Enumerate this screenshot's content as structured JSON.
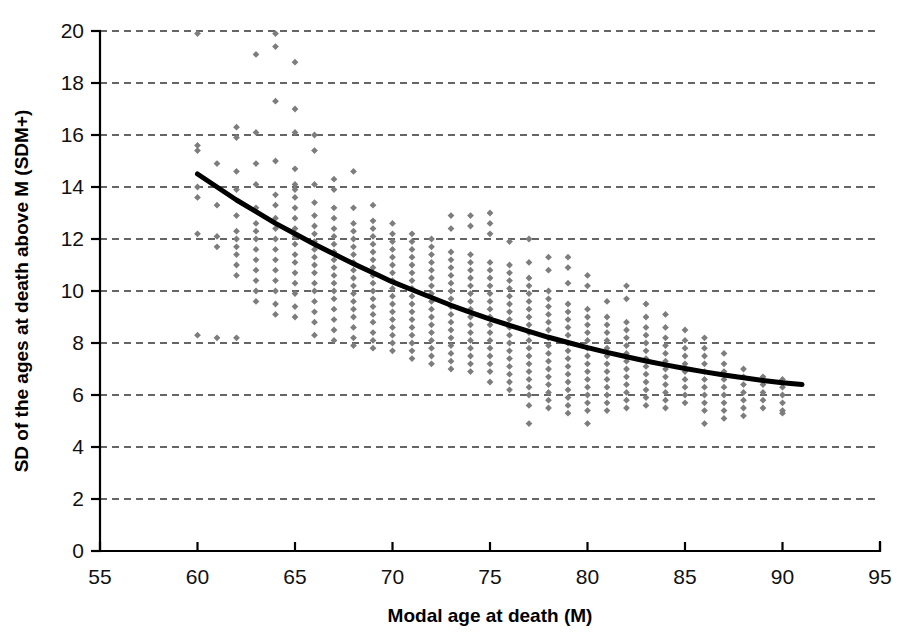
{
  "chart_data": {
    "type": "scatter",
    "title": "",
    "xlabel": "Modal age at death (M)",
    "ylabel": "SD of the ages at death above M (SDM+)",
    "xlim": [
      55,
      95
    ],
    "ylim": [
      0,
      20
    ],
    "xticks": [
      55,
      60,
      65,
      70,
      75,
      80,
      85,
      90,
      95
    ],
    "yticks": [
      0,
      2,
      4,
      6,
      8,
      10,
      12,
      14,
      16,
      18,
      20
    ],
    "grid": "horizontal-dashed",
    "legend": "none",
    "marker_shape": "diamond",
    "marker_color": "#7d7d7d",
    "series": [
      {
        "name": "SDM+ observations",
        "points_by_x": [
          {
            "x": 60,
            "values": [
              19.9,
              15.6,
              15.4,
              14.0,
              13.6,
              12.2,
              8.3
            ]
          },
          {
            "x": 61,
            "values": [
              14.9,
              13.3,
              12.1,
              11.7,
              8.2
            ]
          },
          {
            "x": 62,
            "values": [
              16.3,
              15.9,
              14.6,
              13.9,
              12.9,
              12.3,
              12.0,
              11.7,
              11.4,
              11.0,
              10.6,
              8.2
            ]
          },
          {
            "x": 63,
            "values": [
              19.1,
              16.1,
              14.9,
              14.1,
              13.2,
              12.6,
              12.3,
              12.0,
              11.6,
              11.2,
              10.8,
              10.4,
              10.0,
              9.6
            ]
          },
          {
            "x": 64,
            "values": [
              19.9,
              19.4,
              17.3,
              15.0,
              13.7,
              13.3,
              12.8,
              12.4,
              12.0,
              11.6,
              11.2,
              10.8,
              10.4,
              10.0,
              9.5,
              9.1
            ]
          },
          {
            "x": 65,
            "values": [
              18.8,
              17.0,
              16.1,
              14.7,
              14.1,
              13.9,
              13.6,
              13.2,
              12.8,
              12.4,
              12.1,
              11.8,
              11.4,
              11.1,
              10.7,
              10.3,
              9.9,
              9.4,
              9.0
            ]
          },
          {
            "x": 66,
            "values": [
              16.0,
              15.4,
              14.1,
              13.4,
              12.9,
              12.5,
              12.2,
              11.9,
              11.6,
              11.3,
              11.0,
              10.7,
              10.3,
              10.0,
              9.6,
              9.2,
              8.8,
              8.3
            ]
          },
          {
            "x": 67,
            "values": [
              14.3,
              13.9,
              13.2,
              12.8,
              12.4,
              12.1,
              11.8,
              11.5,
              11.2,
              10.9,
              10.6,
              10.3,
              10.0,
              9.7,
              9.3,
              8.9,
              8.5,
              8.1
            ]
          },
          {
            "x": 68,
            "values": [
              14.6,
              13.2,
              12.6,
              12.3,
              12.0,
              11.7,
              11.4,
              11.1,
              10.8,
              10.5,
              10.2,
              9.9,
              9.6,
              9.3,
              9.0,
              8.6,
              8.2,
              7.9
            ]
          },
          {
            "x": 69,
            "values": [
              13.3,
              12.7,
              12.4,
              12.1,
              11.8,
              11.5,
              11.2,
              10.9,
              10.6,
              10.3,
              10.0,
              9.7,
              9.4,
              9.1,
              8.8,
              8.4,
              8.1,
              7.8
            ]
          },
          {
            "x": 70,
            "values": [
              12.6,
              12.2,
              11.9,
              11.6,
              11.3,
              11.0,
              10.7,
              10.4,
              10.1,
              9.8,
              9.5,
              9.2,
              8.9,
              8.6,
              8.3,
              8.0,
              7.7
            ]
          },
          {
            "x": 71,
            "values": [
              12.2,
              11.9,
              11.6,
              11.3,
              11.0,
              10.7,
              10.4,
              10.1,
              9.8,
              9.5,
              9.2,
              8.9,
              8.6,
              8.3,
              8.0,
              7.7,
              7.4
            ]
          },
          {
            "x": 72,
            "values": [
              12.0,
              11.7,
              11.4,
              11.1,
              10.8,
              10.5,
              10.2,
              9.9,
              9.6,
              9.3,
              9.0,
              8.7,
              8.4,
              8.1,
              7.8,
              7.5,
              7.2
            ]
          },
          {
            "x": 73,
            "values": [
              12.9,
              12.4,
              11.5,
              11.2,
              10.9,
              10.6,
              10.3,
              10.0,
              9.7,
              9.4,
              9.1,
              8.8,
              8.5,
              8.2,
              7.9,
              7.6,
              7.3,
              7.0
            ]
          },
          {
            "x": 74,
            "values": [
              12.9,
              12.5,
              11.4,
              11.1,
              10.8,
              10.5,
              10.2,
              9.9,
              9.6,
              9.3,
              9.0,
              8.7,
              8.4,
              8.1,
              7.8,
              7.5,
              7.2,
              6.9
            ]
          },
          {
            "x": 75,
            "values": [
              13.0,
              12.6,
              12.2,
              11.1,
              10.8,
              10.5,
              10.2,
              9.9,
              9.6,
              9.3,
              9.0,
              8.7,
              8.4,
              8.1,
              7.8,
              7.5,
              7.2,
              6.9,
              6.5
            ]
          },
          {
            "x": 76,
            "values": [
              11.9,
              11.0,
              10.7,
              10.4,
              10.1,
              9.8,
              9.5,
              9.2,
              8.9,
              8.6,
              8.3,
              8.0,
              7.7,
              7.4,
              7.1,
              6.8,
              6.5,
              6.2
            ]
          },
          {
            "x": 77,
            "values": [
              12.0,
              11.1,
              10.5,
              10.2,
              9.9,
              9.6,
              9.3,
              9.0,
              8.7,
              8.4,
              8.1,
              7.8,
              7.5,
              7.2,
              6.9,
              6.6,
              6.3,
              6.0,
              5.6,
              4.9
            ]
          },
          {
            "x": 78,
            "values": [
              11.3,
              10.8,
              10.0,
              9.7,
              9.4,
              9.1,
              8.8,
              8.5,
              8.2,
              7.9,
              7.6,
              7.3,
              7.0,
              6.7,
              6.4,
              6.1,
              5.8,
              5.5
            ]
          },
          {
            "x": 79,
            "values": [
              11.3,
              10.9,
              10.3,
              9.5,
              9.2,
              8.9,
              8.6,
              8.3,
              8.0,
              7.7,
              7.4,
              7.1,
              6.8,
              6.5,
              6.2,
              5.9,
              5.6,
              5.3
            ]
          },
          {
            "x": 80,
            "values": [
              10.6,
              10.2,
              9.3,
              9.0,
              8.7,
              8.4,
              8.1,
              7.8,
              7.5,
              7.2,
              6.9,
              6.6,
              6.3,
              6.0,
              5.7,
              5.4,
              4.9
            ]
          },
          {
            "x": 81,
            "values": [
              9.6,
              9.0,
              8.7,
              8.4,
              8.1,
              7.8,
              7.5,
              7.2,
              6.9,
              6.6,
              6.3,
              6.0,
              5.7,
              5.4
            ]
          },
          {
            "x": 82,
            "values": [
              10.2,
              9.7,
              8.8,
              8.5,
              8.2,
              7.9,
              7.6,
              7.3,
              7.0,
              6.7,
              6.4,
              6.1,
              5.8,
              5.5
            ]
          },
          {
            "x": 83,
            "values": [
              9.5,
              9.0,
              8.6,
              8.3,
              8.0,
              7.7,
              7.4,
              7.1,
              6.8,
              6.5,
              6.2,
              5.9,
              5.6
            ]
          },
          {
            "x": 84,
            "values": [
              9.1,
              8.6,
              8.2,
              7.9,
              7.6,
              7.3,
              7.0,
              6.7,
              6.4,
              6.1,
              5.8,
              5.5
            ]
          },
          {
            "x": 85,
            "values": [
              8.5,
              8.1,
              7.8,
              7.5,
              7.2,
              6.9,
              6.6,
              6.3,
              6.0,
              5.7
            ]
          },
          {
            "x": 86,
            "values": [
              8.2,
              7.8,
              7.5,
              7.2,
              6.9,
              6.6,
              6.3,
              6.0,
              5.7,
              5.4,
              4.9
            ]
          },
          {
            "x": 87,
            "values": [
              7.6,
              7.2,
              6.9,
              6.6,
              6.3,
              6.0,
              5.7,
              5.4,
              5.1
            ]
          },
          {
            "x": 88,
            "values": [
              7.0,
              6.7,
              6.4,
              6.1,
              5.8,
              5.5,
              5.2
            ]
          },
          {
            "x": 89,
            "values": [
              6.7,
              6.4,
              6.1,
              5.8,
              5.5
            ]
          },
          {
            "x": 90,
            "values": [
              6.6,
              6.3,
              6.0,
              5.7,
              5.4,
              5.3
            ]
          }
        ]
      }
    ],
    "trend_curve": {
      "name": "fitted trend",
      "color": "#000000",
      "points": [
        {
          "x": 60.0,
          "y": 14.5
        },
        {
          "x": 61.0,
          "y": 14.0
        },
        {
          "x": 62.0,
          "y": 13.5
        },
        {
          "x": 63.0,
          "y": 13.05
        },
        {
          "x": 64.0,
          "y": 12.6
        },
        {
          "x": 65.0,
          "y": 12.2
        },
        {
          "x": 66.0,
          "y": 11.8
        },
        {
          "x": 67.0,
          "y": 11.42
        },
        {
          "x": 68.0,
          "y": 11.05
        },
        {
          "x": 69.0,
          "y": 10.7
        },
        {
          "x": 70.0,
          "y": 10.35
        },
        {
          "x": 71.0,
          "y": 10.05
        },
        {
          "x": 72.0,
          "y": 9.75
        },
        {
          "x": 73.0,
          "y": 9.45
        },
        {
          "x": 74.0,
          "y": 9.18
        },
        {
          "x": 75.0,
          "y": 8.92
        },
        {
          "x": 76.0,
          "y": 8.68
        },
        {
          "x": 77.0,
          "y": 8.45
        },
        {
          "x": 78.0,
          "y": 8.22
        },
        {
          "x": 79.0,
          "y": 8.02
        },
        {
          "x": 80.0,
          "y": 7.82
        },
        {
          "x": 81.0,
          "y": 7.64
        },
        {
          "x": 82.0,
          "y": 7.47
        },
        {
          "x": 83.0,
          "y": 7.31
        },
        {
          "x": 84.0,
          "y": 7.16
        },
        {
          "x": 85.0,
          "y": 7.02
        },
        {
          "x": 86.0,
          "y": 6.89
        },
        {
          "x": 87.0,
          "y": 6.77
        },
        {
          "x": 88.0,
          "y": 6.66
        },
        {
          "x": 89.0,
          "y": 6.56
        },
        {
          "x": 90.0,
          "y": 6.47
        },
        {
          "x": 91.0,
          "y": 6.4
        }
      ]
    }
  }
}
